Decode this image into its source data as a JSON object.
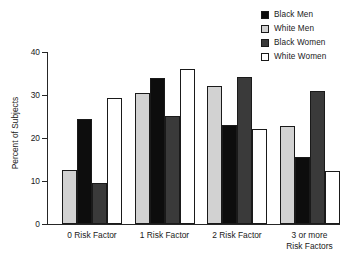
{
  "chart_data": {
    "type": "bar",
    "title": "",
    "subtitle": "",
    "xlabel": "",
    "ylabel": "Percent of Subjects",
    "ylim": [
      0,
      40
    ],
    "yticks": [
      0,
      10,
      20,
      30,
      40
    ],
    "ytick_labels": [
      "0",
      "10",
      "20",
      "30",
      "40"
    ],
    "grid": false,
    "legend_position": "top-right",
    "categories": [
      "0 Risk Factor",
      "1 Risk Factor",
      "2 Risk Factor",
      "3 or more\nRisk Factors"
    ],
    "category_lines": [
      [
        "0 Risk Factor"
      ],
      [
        "1 Risk Factor"
      ],
      [
        "2 Risk Factor"
      ],
      [
        "3 or more",
        "Risk Factors"
      ]
    ],
    "bar_order_in_group": [
      "White Men",
      "Black Men",
      "Black Women",
      "White Women"
    ],
    "series": [
      {
        "name": "Black Men",
        "color": "#0d0d0d",
        "values": [
          24.5,
          34.0,
          23.0,
          15.5
        ]
      },
      {
        "name": "White Men",
        "color": "#d2d2d2",
        "values": [
          12.5,
          30.5,
          32.1,
          22.8
        ]
      },
      {
        "name": "Black Women",
        "color": "#3a3a3a",
        "values": [
          9.5,
          25.2,
          34.2,
          31.0
        ]
      },
      {
        "name": "White Women",
        "color": "#ffffff",
        "values": [
          29.4,
          36.0,
          22.1,
          12.4
        ]
      }
    ]
  },
  "legend": {
    "items": [
      {
        "label": "Black Men",
        "color": "#0d0d0d"
      },
      {
        "label": "White Men",
        "color": "#d2d2d2"
      },
      {
        "label": "Black Women",
        "color": "#3a3a3a"
      },
      {
        "label": "White Women",
        "color": "#ffffff"
      }
    ]
  },
  "axis": {
    "y_title": "Percent of Subjects",
    "y_ticks": [
      "40",
      "30",
      "20",
      "10",
      "0"
    ]
  }
}
